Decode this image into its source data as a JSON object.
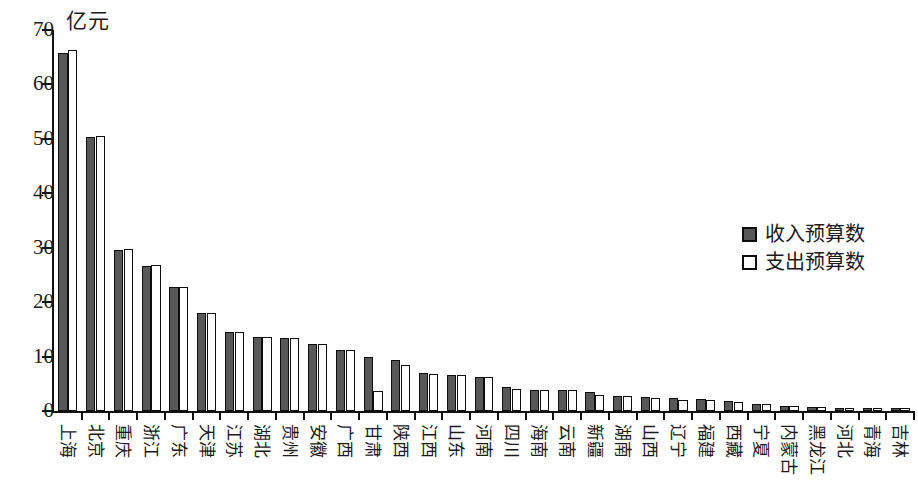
{
  "chart_data": {
    "type": "bar",
    "title": "",
    "ylabel": "亿元",
    "xlabel": "",
    "ylim": [
      0,
      70
    ],
    "yticks": [
      0,
      10,
      20,
      30,
      40,
      50,
      60,
      70
    ],
    "grid": false,
    "legend_position": "right",
    "categories": [
      "上海",
      "北京",
      "重庆",
      "浙江",
      "广东",
      "天津",
      "江苏",
      "湖北",
      "贵州",
      "安徽",
      "广西",
      "甘肃",
      "陕西",
      "江西",
      "山东",
      "河南",
      "四川",
      "海南",
      "云南",
      "新疆",
      "湖南",
      "山西",
      "辽宁",
      "福建",
      "西藏",
      "宁夏",
      "内蒙古",
      "黑龙江",
      "河北",
      "青海",
      "吉林"
    ],
    "series": [
      {
        "name": "收入预算数",
        "color": "#585858",
        "values": [
          65.7,
          50.4,
          29.6,
          26.7,
          22.7,
          18.0,
          14.6,
          13.6,
          13.4,
          12.4,
          11.3,
          10.0,
          9.4,
          6.9,
          6.7,
          6.3,
          4.5,
          3.9,
          3.8,
          3.5,
          2.7,
          2.5,
          2.3,
          2.2,
          1.9,
          1.2,
          1.0,
          0.7,
          0.6,
          0.5,
          0.5
        ]
      },
      {
        "name": "支出预算数",
        "color": "#ffffff",
        "values": [
          66.3,
          50.6,
          29.7,
          26.8,
          22.8,
          18.0,
          14.6,
          13.6,
          13.4,
          12.4,
          11.3,
          3.6,
          8.5,
          6.8,
          6.7,
          6.3,
          4.0,
          3.9,
          3.8,
          3.0,
          2.7,
          2.3,
          2.1,
          2.0,
          1.7,
          1.2,
          1.0,
          0.8,
          0.6,
          0.5,
          0.5
        ]
      }
    ]
  },
  "legend": {
    "items": [
      {
        "label": "收入预算数",
        "swatch": "filled-dark-square-icon"
      },
      {
        "label": "支出预算数",
        "swatch": "hollow-white-square-icon"
      }
    ]
  }
}
